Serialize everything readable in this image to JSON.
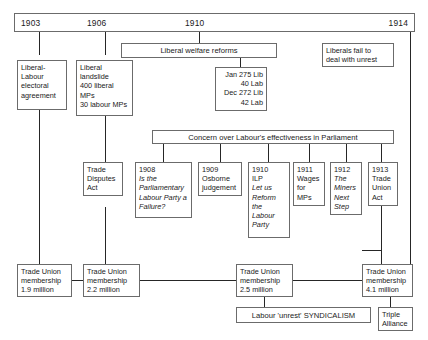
{
  "diagram": {
    "title_label": "Liberal and Labour politics timeline 1903-1914",
    "timeline": {
      "years": [
        "1903",
        "1906",
        "1910",
        "1914"
      ]
    },
    "banners": {
      "welfare_reforms": "Liberal welfare reforms",
      "concern_labour": "Concern over Labour's effectiveness in Parliament",
      "labour_unrest": "Labour 'unrest' SYNDICALISM"
    },
    "boxes": {
      "lib_lab_pact": [
        "Liberal-",
        "Labour",
        "electoral",
        "agreement"
      ],
      "liberal_landslide": [
        "Liberal",
        "landslide",
        "400 liberal",
        "MPs",
        "30 labour MPs"
      ],
      "elections_1910": [
        "Jan 275 Lib",
        "40 Lab",
        "Dec 272 Lib",
        "42 Lab"
      ],
      "liberals_fail": [
        "Liberals fail to",
        "deal with unrest"
      ],
      "trade_disputes_act": [
        "Trade",
        "Disputes",
        "Act"
      ],
      "pamphlet_1908": {
        "year": "1908",
        "lines": [
          {
            "text": "Is the",
            "italic": true
          },
          {
            "text": "Parliamentary",
            "italic": true
          },
          {
            "text": "Labour Party a",
            "italic": true
          },
          {
            "text": "Failure?",
            "italic": true
          }
        ]
      },
      "osborne_1909": {
        "year": "1909",
        "lines": [
          {
            "text": "Osborne",
            "italic": false
          },
          {
            "text": "judgement",
            "italic": false
          }
        ]
      },
      "ilp_1910": {
        "year": "1910",
        "lines": [
          {
            "text": "ILP",
            "italic": false
          },
          {
            "text": "Let us",
            "italic": true
          },
          {
            "text": "Reform",
            "italic": true
          },
          {
            "text": "the",
            "italic": true
          },
          {
            "text": "Labour",
            "italic": true
          },
          {
            "text": "Party",
            "italic": true
          }
        ]
      },
      "wages_1911": {
        "year": "1911",
        "lines": [
          {
            "text": "Wages",
            "italic": false
          },
          {
            "text": "for",
            "italic": false
          },
          {
            "text": "MPs",
            "italic": false
          }
        ]
      },
      "miners_1912": {
        "year": "1912",
        "lines": [
          {
            "text": "The",
            "italic": true
          },
          {
            "text": "Miners",
            "italic": true
          },
          {
            "text": "Next",
            "italic": true
          },
          {
            "text": "Step",
            "italic": true
          }
        ]
      },
      "tua_1913": {
        "year": "1913",
        "lines": [
          {
            "text": "Trade",
            "italic": false
          },
          {
            "text": "Union",
            "italic": false
          },
          {
            "text": "Act",
            "italic": false
          }
        ]
      },
      "membership_1903": [
        "Trade Union",
        "membership",
        "1.9 million"
      ],
      "membership_1906": [
        "Trade Union",
        "membership",
        "2.2 million"
      ],
      "membership_1910": [
        "Trade Union",
        "membership",
        "2.5 million"
      ],
      "membership_1914": [
        "Trade Union",
        "membership",
        "4.1 million"
      ],
      "triple_alliance": [
        "Triple",
        "Alliance"
      ]
    }
  }
}
